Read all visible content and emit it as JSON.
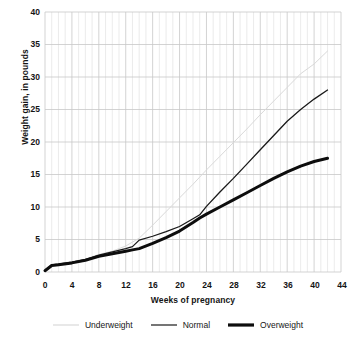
{
  "chart_data": {
    "type": "line",
    "title": "",
    "xlabel": "Weeks of pregnancy",
    "ylabel": "Weight gain, in pounds",
    "xlim": [
      0,
      44
    ],
    "ylim": [
      0,
      40
    ],
    "xticks": [
      "0",
      "4",
      "8",
      "12",
      "16",
      "20",
      "24",
      "28",
      "32",
      "36",
      "40",
      "44"
    ],
    "yticks": [
      "0",
      "5",
      "10",
      "15",
      "20",
      "25",
      "30",
      "35",
      "40"
    ],
    "grid": "both-axes, minor vertical gridlines every week",
    "legend_position": "bottom-center",
    "x": [
      0,
      1,
      2,
      4,
      6,
      8,
      10,
      12,
      13,
      14,
      16,
      18,
      20,
      22,
      23,
      24,
      26,
      28,
      30,
      32,
      34,
      36,
      38,
      40,
      42
    ],
    "series": [
      {
        "name": "Underweight",
        "color": "#d9d9d9",
        "width": 1.0,
        "values": [
          0.2,
          1.1,
          1.3,
          1.6,
          2.0,
          2.7,
          3.2,
          4.0,
          4.6,
          5.2,
          7.2,
          9.3,
          11.4,
          13.5,
          14.6,
          15.7,
          17.8,
          19.9,
          22.0,
          24.2,
          26.3,
          28.4,
          30.5,
          32.0,
          34.0
        ]
      },
      {
        "name": "Normal",
        "color": "#1a1a1a",
        "width": 1.3,
        "values": [
          0.2,
          1.1,
          1.2,
          1.5,
          1.9,
          2.6,
          3.1,
          3.6,
          3.9,
          4.9,
          5.5,
          6.2,
          7.0,
          8.2,
          8.8,
          10.1,
          12.3,
          14.4,
          16.6,
          18.8,
          21.0,
          23.2,
          25.0,
          26.6,
          28.0
        ]
      },
      {
        "name": "Overweight",
        "color": "#0d0d0d",
        "width": 3.0,
        "values": [
          0.2,
          1.0,
          1.1,
          1.4,
          1.8,
          2.4,
          2.8,
          3.2,
          3.4,
          3.6,
          4.4,
          5.3,
          6.3,
          7.6,
          8.3,
          8.9,
          10.0,
          11.1,
          12.2,
          13.3,
          14.4,
          15.4,
          16.3,
          17.0,
          17.5
        ]
      }
    ]
  },
  "legend": {
    "items": [
      {
        "label": "Underweight"
      },
      {
        "label": "Normal"
      },
      {
        "label": "Overweight"
      }
    ]
  },
  "colors": {
    "underweight": "#d9d9d9",
    "normal": "#1a1a1a",
    "overweight": "#0d0d0d",
    "grid_major": "#c8c8c8",
    "grid_minor": "#e2e2e2",
    "text": "#141414",
    "background": "#ffffff"
  }
}
